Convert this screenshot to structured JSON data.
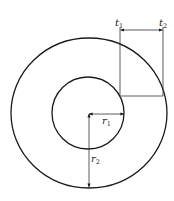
{
  "diagram": {
    "type": "concentric-circles-thickness",
    "colors": {
      "stroke": "#1a1a1a",
      "background": "#ffffff"
    },
    "outer_circle": {
      "cx": 89,
      "cy": 113,
      "rx": 78,
      "ry": 75
    },
    "inner_circle": {
      "cx": 88,
      "cy": 113,
      "r": 36
    },
    "labels": {
      "t1": {
        "base": "t",
        "sub": "1"
      },
      "t2": {
        "base": "t",
        "sub": "2"
      },
      "r1": {
        "base": "r",
        "sub": "1"
      },
      "r2": {
        "base": "r",
        "sub": "2"
      }
    }
  }
}
